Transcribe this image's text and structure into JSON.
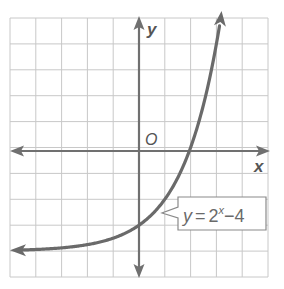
{
  "chart_data": {
    "type": "line",
    "title": "",
    "xlabel": "x",
    "ylabel": "y",
    "origin_label": "O",
    "xlim": [
      -5,
      5
    ],
    "ylim": [
      -5,
      5
    ],
    "grid": true,
    "grid_step": 1,
    "legend": null,
    "series": [
      {
        "name": "y = 2^x - 4",
        "function": "2^x - 4",
        "horizontal_asymptote": -4,
        "x": [
          -5,
          -4,
          -3,
          -2,
          -1,
          0,
          1,
          2,
          3,
          3.17
        ],
        "y": [
          -3.97,
          -3.94,
          -3.88,
          -3.75,
          -3.5,
          -3,
          -2,
          0,
          4,
          5
        ],
        "arrows": "both ends"
      }
    ],
    "annotations": [
      {
        "text": "y = 2^x − 4",
        "points_to": [
          -0.5,
          -3.3
        ]
      }
    ]
  },
  "labels": {
    "x_axis": "x",
    "y_axis": "y",
    "origin": "O",
    "equation_y": "y",
    "equation_eq": "=",
    "equation_base": "2",
    "equation_exp": "x",
    "equation_rest": "−4"
  },
  "colors": {
    "grid": "#c8c8c8",
    "axis": "#707070",
    "curve": "#6a6a6a",
    "text": "#555555"
  }
}
